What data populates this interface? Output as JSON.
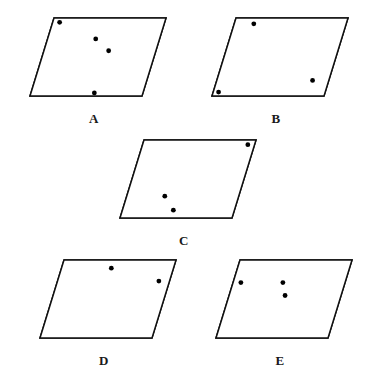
{
  "page": {
    "background_color": "#ffffff",
    "line_color": "#111111",
    "dot_color": "#000000",
    "width": 373,
    "height": 373
  },
  "figures": [
    {
      "id": "A",
      "label": "A",
      "origin": {
        "x": 14,
        "y": 8
      },
      "box": {
        "w": 160,
        "h": 100
      },
      "shape": {
        "comment": "parallelogram skewed to the right",
        "top_left": {
          "x": 40,
          "y": 10
        },
        "top_right": {
          "x": 152,
          "y": 10
        },
        "bottom_right": {
          "x": 128,
          "y": 88
        },
        "bottom_left": {
          "x": 16,
          "y": 88
        }
      },
      "vertical_stripes": [
        {
          "t": 0.035,
          "width": 0.055
        },
        {
          "t": 0.555,
          "width": 0.03
        },
        {
          "t": 0.625,
          "width": 0.03
        }
      ],
      "horizontal_stripes": [
        {
          "t": 0.2,
          "width": 0.14
        }
      ],
      "dots": [
        {
          "u": 0.062,
          "v": 0.055
        },
        {
          "u": 0.43,
          "v": 0.268
        },
        {
          "u": 0.578,
          "v": 0.42
        },
        {
          "u": 0.566,
          "v": 0.96
        }
      ],
      "label_y": 104
    },
    {
      "id": "B",
      "label": "B",
      "origin": {
        "x": 196,
        "y": 8
      },
      "box": {
        "w": 160,
        "h": 100
      },
      "shape": {
        "top_left": {
          "x": 40,
          "y": 10
        },
        "top_right": {
          "x": 152,
          "y": 10
        },
        "bottom_right": {
          "x": 128,
          "y": 88
        },
        "bottom_left": {
          "x": 16,
          "y": 88
        }
      },
      "vertical_stripes": [
        {
          "t": 0.015,
          "width": 0.045
        },
        {
          "t": 0.095,
          "width": 0.045
        },
        {
          "t": 0.83,
          "width": 0.04
        },
        {
          "t": 0.905,
          "width": 0.04
        }
      ],
      "horizontal_stripes": [
        {
          "t": 0.855,
          "width": 0.135
        }
      ],
      "dots": [
        {
          "u": 0.175,
          "v": 0.075
        },
        {
          "u": 0.855,
          "v": 0.8
        },
        {
          "u": 0.048,
          "v": 0.95
        }
      ],
      "label_y": 104
    },
    {
      "id": "C",
      "label": "C",
      "origin": {
        "x": 104,
        "y": 130
      },
      "box": {
        "w": 160,
        "h": 100
      },
      "shape": {
        "top_left": {
          "x": 40,
          "y": 10
        },
        "top_right": {
          "x": 152,
          "y": 10
        },
        "bottom_right": {
          "x": 128,
          "y": 88
        },
        "bottom_left": {
          "x": 16,
          "y": 88
        }
      },
      "vertical_stripes": [
        {
          "t": 0.425,
          "width": 0.033
        },
        {
          "t": 0.5,
          "width": 0.033
        },
        {
          "t": 0.88,
          "width": 0.05
        }
      ],
      "horizontal_stripes": [
        {
          "t": 0.66,
          "width": 0.12
        }
      ],
      "dots": [
        {
          "u": 0.94,
          "v": 0.06
        },
        {
          "u": 0.34,
          "v": 0.72
        },
        {
          "u": 0.455,
          "v": 0.9
        }
      ],
      "label_y": 104
    },
    {
      "id": "D",
      "label": "D",
      "origin": {
        "x": 24,
        "y": 250
      },
      "box": {
        "w": 160,
        "h": 100
      },
      "shape": {
        "top_left": {
          "x": 40,
          "y": 10
        },
        "top_right": {
          "x": 152,
          "y": 10
        },
        "bottom_right": {
          "x": 128,
          "y": 88
        },
        "bottom_left": {
          "x": 16,
          "y": 88
        }
      },
      "vertical_stripes": [
        {
          "t": 0.43,
          "width": 0.03
        },
        {
          "t": 0.49,
          "width": 0.03
        },
        {
          "t": 0.895,
          "width": 0.045
        }
      ],
      "horizontal_stripes": [
        {
          "t": 0.035,
          "width": 0.11
        },
        {
          "t": 0.19,
          "width": 0.11
        }
      ],
      "dots": [
        {
          "u": 0.445,
          "v": 0.105
        },
        {
          "u": 0.905,
          "v": 0.27
        }
      ],
      "label_y": 104
    },
    {
      "id": "E",
      "label": "E",
      "origin": {
        "x": 200,
        "y": 250
      },
      "box": {
        "w": 160,
        "h": 100
      },
      "shape": {
        "top_left": {
          "x": 40,
          "y": 10
        },
        "top_right": {
          "x": 152,
          "y": 10
        },
        "bottom_right": {
          "x": 128,
          "y": 88
        },
        "bottom_left": {
          "x": 16,
          "y": 88
        }
      },
      "vertical_stripes": [
        {
          "t": 0.03,
          "width": 0.048
        },
        {
          "t": 0.43,
          "width": 0.03
        },
        {
          "t": 0.495,
          "width": 0.03
        }
      ],
      "horizontal_stripes": [
        {
          "t": 0.23,
          "width": 0.115
        },
        {
          "t": 0.4,
          "width": 0.105
        }
      ],
      "dots": [
        {
          "u": 0.07,
          "v": 0.29
        },
        {
          "u": 0.445,
          "v": 0.29
        },
        {
          "u": 0.5,
          "v": 0.455
        }
      ],
      "label_y": 104
    }
  ]
}
